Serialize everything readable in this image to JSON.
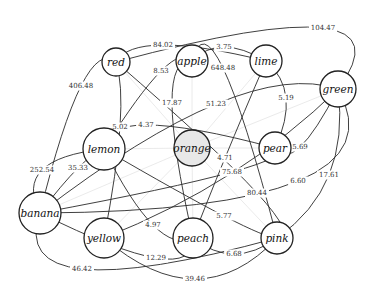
{
  "diagram": {
    "type": "weighted-graph",
    "center_node": "orange",
    "nodes": [
      {
        "id": "red",
        "label": "red",
        "x": 116,
        "y": 62,
        "r": 14
      },
      {
        "id": "apple",
        "label": "apple",
        "x": 192,
        "y": 61,
        "r": 16
      },
      {
        "id": "lime",
        "label": "lime",
        "x": 266,
        "y": 61,
        "r": 16
      },
      {
        "id": "green",
        "label": "green",
        "x": 338,
        "y": 89,
        "r": 18
      },
      {
        "id": "lemon",
        "label": "lemon",
        "x": 104,
        "y": 149,
        "r": 21
      },
      {
        "id": "orange",
        "label": "orange",
        "x": 192,
        "y": 148,
        "r": 18
      },
      {
        "id": "pear",
        "label": "pear",
        "x": 275,
        "y": 148,
        "r": 16
      },
      {
        "id": "banana",
        "label": "banana",
        "x": 40,
        "y": 213,
        "r": 21
      },
      {
        "id": "yellow",
        "label": "yellow",
        "x": 104,
        "y": 238,
        "r": 20
      },
      {
        "id": "peach",
        "label": "peach",
        "x": 193,
        "y": 238,
        "r": 20
      },
      {
        "id": "pink",
        "label": "pink",
        "x": 277,
        "y": 238,
        "r": 16
      }
    ],
    "edges": [
      {
        "from": "red",
        "to": "green",
        "weight": "104.47",
        "lx": 323,
        "ly": 28
      },
      {
        "from": "red",
        "to": "lime",
        "weight": "84.02",
        "lx": 163,
        "ly": 45
      },
      {
        "from": "apple",
        "to": "lime",
        "weight": "3.75",
        "lx": 224,
        "ly": 47
      },
      {
        "from": "lemon",
        "to": "apple",
        "weight": "8.53",
        "lx": 161,
        "ly": 71
      },
      {
        "from": "apple",
        "to": "pink",
        "weight": "648.48",
        "lx": 223,
        "ly": 68
      },
      {
        "from": "red",
        "to": "banana",
        "weight": "406.48",
        "lx": 81,
        "ly": 86
      },
      {
        "from": "apple",
        "to": "peach",
        "weight": "17.87",
        "lx": 172,
        "ly": 103
      },
      {
        "from": "banana",
        "to": "green",
        "weight": "51.23",
        "lx": 216,
        "ly": 104
      },
      {
        "from": "lime",
        "to": "pear",
        "weight": "5.19",
        "lx": 286,
        "ly": 98
      },
      {
        "from": "red",
        "to": "yellow",
        "weight": "5.02",
        "lx": 120,
        "ly": 127
      },
      {
        "from": "lemon",
        "to": "pear",
        "weight": "4.37",
        "lx": 146,
        "ly": 125
      },
      {
        "from": "lime",
        "to": "peach",
        "weight": "4.71",
        "lx": 225,
        "ly": 158
      },
      {
        "from": "banana",
        "to": "pear",
        "weight": "75.68",
        "lx": 232,
        "ly": 172
      },
      {
        "from": "pear",
        "to": "green",
        "weight": "5.69",
        "lx": 300,
        "ly": 147
      },
      {
        "from": "lemon",
        "to": "banana",
        "weight": "252.54",
        "lx": 42,
        "ly": 170
      },
      {
        "from": "lemon",
        "to": "banana",
        "weight": "35.33",
        "lx": 78,
        "ly": 168
      },
      {
        "from": "red",
        "to": "pink",
        "weight": "80.44",
        "lx": 257,
        "ly": 193
      },
      {
        "from": "green",
        "to": "banana",
        "weight": "6.60",
        "lx": 298,
        "ly": 181
      },
      {
        "from": "green",
        "to": "pink",
        "weight": "17.61",
        "lx": 329,
        "ly": 175
      },
      {
        "from": "lemon",
        "to": "peach",
        "weight": "4.97",
        "lx": 153,
        "ly": 225
      },
      {
        "from": "lemon",
        "to": "pink",
        "weight": "5.77",
        "lx": 224,
        "ly": 216
      },
      {
        "from": "banana",
        "to": "peach",
        "weight": "12.29",
        "lx": 156,
        "ly": 258
      },
      {
        "from": "peach",
        "to": "pink",
        "weight": "6.68",
        "lx": 234,
        "ly": 254
      },
      {
        "from": "banana",
        "to": "pink",
        "weight": "46.42",
        "lx": 82,
        "ly": 269
      },
      {
        "from": "yellow",
        "to": "pink",
        "weight": "39.46",
        "lx": 195,
        "ly": 279
      },
      {
        "from": "yellow",
        "to": "green",
        "weight": "",
        "lx": 0,
        "ly": 0
      }
    ]
  }
}
